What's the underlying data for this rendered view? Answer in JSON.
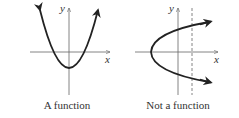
{
  "figures": [
    {
      "caption": "A function",
      "axis_labels": {
        "x": "x",
        "y": "y"
      },
      "curve": "upward parabola"
    },
    {
      "caption": "Not a function",
      "axis_labels": {
        "x": "x",
        "y": "y"
      },
      "curve": "sideways parabola opening right",
      "vertical_line_test": "dashed vertical line"
    }
  ],
  "colors": {
    "curve": "#222222",
    "axis": "#555555",
    "dashed": "#666666"
  }
}
